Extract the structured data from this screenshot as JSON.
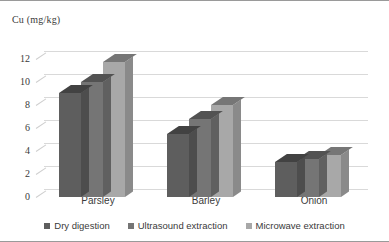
{
  "chart_data": {
    "type": "bar",
    "title": "",
    "ylabel": "Cu (mg/kg)",
    "xlabel": "",
    "categories": [
      "Parsley",
      "Barley",
      "Onion"
    ],
    "series": [
      {
        "name": "Dry digestion",
        "values": [
          9.0,
          5.5,
          3.0
        ],
        "color": "#5e5e5e"
      },
      {
        "name": "Ultrasound extraction",
        "values": [
          10.0,
          6.8,
          3.3
        ],
        "color": "#757575"
      },
      {
        "name": "Microwave extraction",
        "values": [
          11.7,
          8.0,
          3.6
        ],
        "color": "#a8a8a8"
      }
    ],
    "ylim": [
      0,
      13
    ],
    "yticks": [
      0,
      2,
      4,
      6,
      8,
      10,
      12
    ],
    "grid": true,
    "legend_position": "bottom",
    "style": "3d-clustered-column"
  },
  "legend": {
    "items": [
      {
        "label": "Dry digestion",
        "color": "#5e5e5e"
      },
      {
        "label": "Ultrasound extraction",
        "color": "#757575"
      },
      {
        "label": "Microwave extraction",
        "color": "#a8a8a8"
      }
    ]
  },
  "axes": {
    "y_title": "Cu (mg/kg)",
    "y_ticks": [
      "0",
      "2",
      "4",
      "6",
      "8",
      "10",
      "12"
    ],
    "x_ticks": [
      "Parsley",
      "Barley",
      "Onion"
    ]
  }
}
